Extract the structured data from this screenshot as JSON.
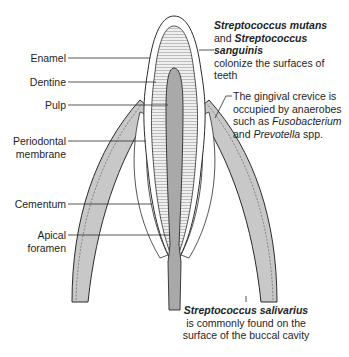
{
  "diagram": {
    "type": "anatomical",
    "colors": {
      "gum": "#c8c8c8",
      "pulp": "#a9a9a9",
      "dentine": "#e6e6e6",
      "enamel": "#ffffff",
      "outline": "#2b2b2b"
    }
  },
  "labels_left": {
    "enamel": "Enamel",
    "dentine": "Dentine",
    "pulp": "Pulp",
    "periodontal_line1": "Periodontal",
    "periodontal_line2": "membrane",
    "cementum": "Cementum",
    "apical_line1": "Apical",
    "apical_line2": "foramen"
  },
  "annotation_top": {
    "species1": "Streptococcus mutans",
    "and": "and ",
    "species2": "Streptococcus sanguinis",
    "line3": "colonize the surfaces of",
    "line4": "teeth"
  },
  "annotation_middle": {
    "line1": "The gingival crevice is",
    "line2": "occupied by anaerobes",
    "line3_prefix": "such as ",
    "genus1": "Fusobacterium",
    "line4_prefix": "and ",
    "genus2": "Prevotella",
    "line4_suffix": " spp."
  },
  "annotation_bottom": {
    "species": "Streptococcus salivarius",
    "line2": "is commonly found on the",
    "line3": "surface of the buccal cavity"
  }
}
